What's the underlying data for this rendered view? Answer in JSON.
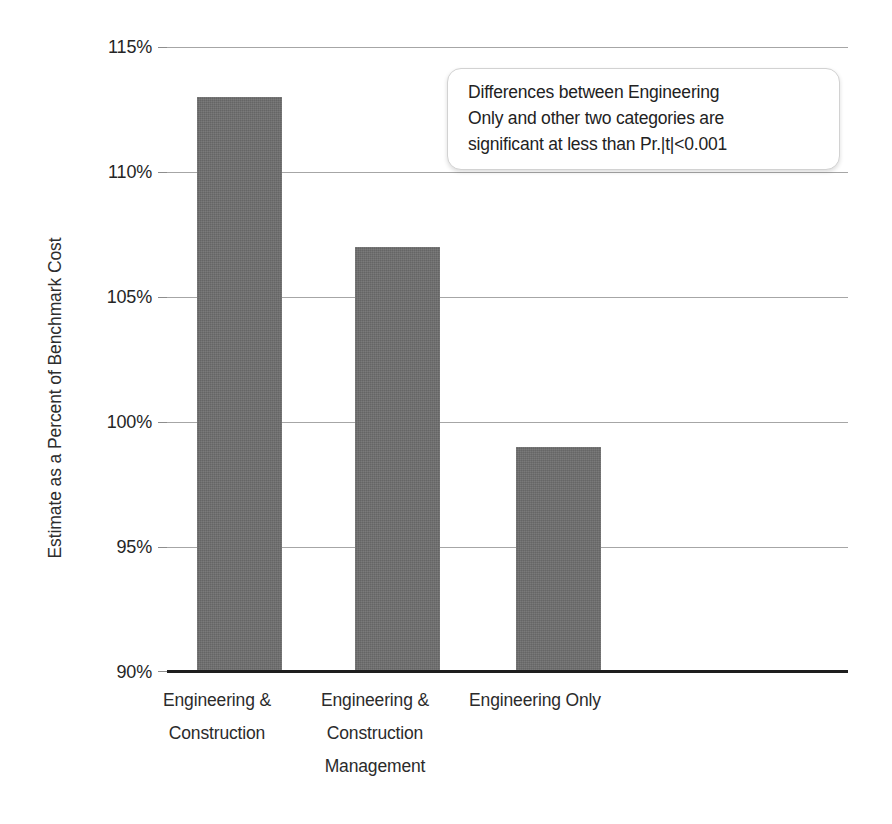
{
  "chart_data": {
    "type": "bar",
    "title": "",
    "subtitle": "",
    "xlabel": "",
    "ylabel": "Estimate as a Percent of Benchmark Cost",
    "categories": [
      "Engineering &\nConstruction",
      "Engineering &\nConstruction\nManagement",
      "Engineering Only"
    ],
    "category_lines": [
      [
        "Engineering &",
        "Construction"
      ],
      [
        "Engineering &",
        "Construction",
        "Management"
      ],
      [
        "Engineering Only"
      ]
    ],
    "values": [
      113,
      107,
      99
    ],
    "value_labels": [
      "113%",
      "107%",
      "99%"
    ],
    "ylim": [
      90,
      115
    ],
    "yticks": [
      90,
      95,
      100,
      105,
      110,
      115
    ],
    "ytick_labels": [
      "90%",
      "95%",
      "100%",
      "105%",
      "110%",
      "115%"
    ],
    "grid": true,
    "grid_axis": "y",
    "legend": false,
    "legend_position": "none",
    "bar_color": "#6E6E6E",
    "gridline_color": "#A6A6A6",
    "axis_color": "#1E1E1E",
    "text_color": "#2A2A2A",
    "background_color": "#FFFFFF",
    "annotations": [
      {
        "name": "significance-note",
        "lines": [
          "Differences between Engineering",
          "Only and other two categories are",
          "significant at less than Pr.|t|<0.001"
        ],
        "text": "Differences between Engineering Only and other two categories are significant at less than Pr.|t|<0.001"
      }
    ]
  }
}
